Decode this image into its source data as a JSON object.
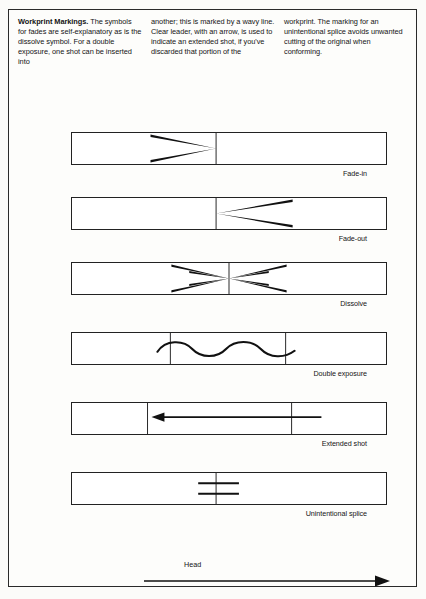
{
  "document": {
    "title": "Workprint Markings",
    "columns": [
      {
        "lead": "Workprint Markings.",
        "body": " The symbols for fades are self-explanatory as is the dissolve symbol. For a double exposure, one shot can be inserted into"
      },
      {
        "lead": "",
        "body": "another; this is marked by a wavy line. Clear leader, with an arrow, is used to indicate an extended shot, if you've discarded that portion of the"
      },
      {
        "lead": "",
        "body": "workprint. The marking for an unintentional splice avoids unwanted cutting of the original when conforming."
      }
    ]
  },
  "diagram": {
    "head_label": "Head",
    "strips": [
      {
        "id": "fade-in",
        "label": "Fade-in",
        "symbol": "converging-wedge"
      },
      {
        "id": "fade-out",
        "label": "Fade-out",
        "symbol": "diverging-wedge"
      },
      {
        "id": "dissolve",
        "label": "Dissolve",
        "symbol": "bowtie-x"
      },
      {
        "id": "double-exposure",
        "label": "Double exposure",
        "symbol": "wavy-line"
      },
      {
        "id": "extended-shot",
        "label": "Extended shot",
        "symbol": "left-arrow"
      },
      {
        "id": "unintentional-splice",
        "label": "Unintentional splice",
        "symbol": "double-cross-bar"
      }
    ]
  },
  "colors": {
    "ink": "#1a1a1a",
    "paper": "#fdfdfb",
    "rule": "#222222"
  }
}
